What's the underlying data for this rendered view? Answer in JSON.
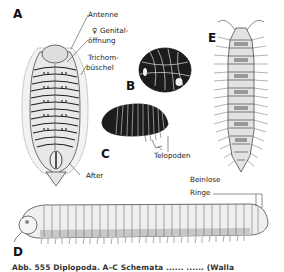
{
  "figure": {
    "panels": [
      {
        "letter": "A",
        "subject": "flat-backed millipede with trichome tufts, ventral view"
      },
      {
        "letter": "B",
        "subject": "pill millipede rolled into a ball"
      },
      {
        "letter": "C",
        "subject": "pill millipede, lateral view"
      },
      {
        "letter": "D",
        "subject": "cylindrical millipede, lateral view"
      },
      {
        "letter": "E",
        "subject": "flat-backed millipede, dorsal view"
      }
    ],
    "labels": {
      "antenne": "Antenne",
      "genital_symbol": "♀",
      "genital_1": "Genital-",
      "genital_2": "öffnung",
      "trichom_1": "Trichom-",
      "trichom_2": "büschel",
      "after": "After",
      "telopoden": "Telopoden",
      "beinlose": "Beinlose",
      "ringe": "Ringe"
    },
    "caption": "Abb. 555  Diplopoda. A–C Schemata ......  ......  (Walla"
  },
  "colors": {
    "ink": "#1a1a1a",
    "shade": "#888888",
    "light_fill": "#e6e6e6",
    "background": "#ffffff"
  }
}
